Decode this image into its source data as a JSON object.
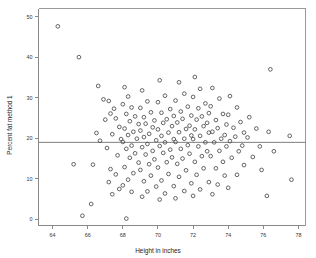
{
  "chart_data": {
    "type": "scatter",
    "title": "",
    "xlabel": "Height in inches",
    "ylabel": "Percent fat method 1",
    "xlim": [
      63.2,
      78.4
    ],
    "ylim": [
      -1.5,
      52.0
    ],
    "xticks": [
      64,
      66,
      68,
      70,
      72,
      74,
      76,
      78
    ],
    "xtick_labels": [
      "64",
      "66",
      "68",
      "70",
      "72",
      "74",
      "76",
      "78"
    ],
    "yticks": [
      0,
      10,
      20,
      30,
      40,
      50
    ],
    "ytick_labels": [
      "0",
      "10",
      "20",
      "30",
      "40",
      "50"
    ],
    "grid": false,
    "legend": false,
    "marker": "open-circle",
    "marker_color": "#4a4a4a",
    "frame_color": "#9a9a9a",
    "reference_lines": [
      {
        "orientation": "horizontal",
        "value": 19.0,
        "color": "#6f6f6f",
        "label": "mean percent fat"
      }
    ],
    "series": [
      {
        "name": "Percent fat method 1 vs Height",
        "points": [
          [
            64.3,
            47.6
          ],
          [
            65.5,
            40.0
          ],
          [
            66.6,
            32.9
          ],
          [
            66.9,
            29.6
          ],
          [
            67.2,
            29.2
          ],
          [
            67.3,
            26.1
          ],
          [
            67.0,
            24.6
          ],
          [
            66.5,
            21.3
          ],
          [
            66.7,
            19.4
          ],
          [
            66.3,
            13.5
          ],
          [
            66.2,
            3.8
          ],
          [
            65.2,
            13.6
          ],
          [
            65.7,
            0.9
          ],
          [
            67.5,
            27.3
          ],
          [
            67.6,
            24.9
          ],
          [
            67.8,
            22.8
          ],
          [
            67.4,
            21.0
          ],
          [
            67.9,
            19.8
          ],
          [
            67.1,
            17.6
          ],
          [
            67.7,
            15.8
          ],
          [
            67.3,
            12.4
          ],
          [
            67.6,
            11.1
          ],
          [
            67.2,
            9.2
          ],
          [
            67.8,
            7.5
          ],
          [
            67.4,
            6.2
          ],
          [
            68.1,
            32.6
          ],
          [
            68.3,
            30.3
          ],
          [
            68.0,
            28.4
          ],
          [
            68.5,
            27.6
          ],
          [
            68.2,
            26.0
          ],
          [
            68.7,
            25.4
          ],
          [
            68.4,
            24.2
          ],
          [
            68.9,
            23.5
          ],
          [
            68.1,
            22.4
          ],
          [
            68.6,
            21.6
          ],
          [
            68.3,
            20.8
          ],
          [
            68.8,
            19.9
          ],
          [
            68.0,
            19.1
          ],
          [
            68.5,
            18.2
          ],
          [
            68.2,
            17.4
          ],
          [
            68.7,
            16.3
          ],
          [
            68.4,
            15.2
          ],
          [
            68.9,
            14.0
          ],
          [
            68.1,
            12.9
          ],
          [
            68.6,
            11.4
          ],
          [
            68.3,
            9.8
          ],
          [
            68.0,
            8.4
          ],
          [
            68.5,
            6.8
          ],
          [
            68.2,
            0.2
          ],
          [
            69.1,
            31.8
          ],
          [
            69.4,
            29.1
          ],
          [
            69.0,
            27.5
          ],
          [
            69.6,
            26.4
          ],
          [
            69.2,
            25.2
          ],
          [
            69.8,
            24.4
          ],
          [
            69.3,
            23.6
          ],
          [
            69.7,
            22.7
          ],
          [
            69.0,
            21.9
          ],
          [
            69.5,
            21.1
          ],
          [
            69.2,
            20.3
          ],
          [
            69.9,
            19.5
          ],
          [
            69.4,
            18.6
          ],
          [
            69.1,
            17.8
          ],
          [
            69.7,
            16.9
          ],
          [
            69.3,
            16.0
          ],
          [
            69.8,
            14.8
          ],
          [
            69.5,
            13.6
          ],
          [
            69.0,
            12.2
          ],
          [
            69.6,
            10.8
          ],
          [
            69.2,
            9.4
          ],
          [
            69.9,
            8.1
          ],
          [
            69.4,
            6.9
          ],
          [
            69.1,
            5.6
          ],
          [
            70.1,
            34.3
          ],
          [
            70.4,
            30.5
          ],
          [
            70.0,
            28.9
          ],
          [
            70.7,
            27.2
          ],
          [
            70.2,
            26.3
          ],
          [
            70.9,
            25.5
          ],
          [
            70.5,
            24.7
          ],
          [
            70.3,
            23.8
          ],
          [
            70.8,
            23.0
          ],
          [
            70.0,
            22.2
          ],
          [
            70.6,
            21.4
          ],
          [
            70.2,
            20.6
          ],
          [
            70.9,
            19.8
          ],
          [
            70.4,
            19.0
          ],
          [
            70.1,
            18.1
          ],
          [
            70.7,
            17.2
          ],
          [
            70.3,
            16.4
          ],
          [
            70.8,
            15.3
          ],
          [
            70.5,
            14.1
          ],
          [
            70.0,
            12.8
          ],
          [
            70.6,
            11.2
          ],
          [
            70.2,
            9.6
          ],
          [
            70.9,
            8.2
          ],
          [
            70.4,
            6.4
          ],
          [
            70.1,
            4.9
          ],
          [
            71.2,
            33.8
          ],
          [
            71.5,
            31.0
          ],
          [
            71.0,
            29.3
          ],
          [
            71.7,
            27.8
          ],
          [
            71.3,
            26.6
          ],
          [
            71.9,
            25.6
          ],
          [
            71.4,
            24.8
          ],
          [
            71.1,
            23.9
          ],
          [
            71.8,
            23.1
          ],
          [
            71.6,
            22.3
          ],
          [
            71.2,
            21.5
          ],
          [
            71.9,
            20.7
          ],
          [
            71.5,
            19.9
          ],
          [
            71.0,
            19.1
          ],
          [
            71.7,
            18.3
          ],
          [
            71.3,
            17.4
          ],
          [
            71.8,
            16.2
          ],
          [
            71.4,
            15.0
          ],
          [
            71.1,
            13.7
          ],
          [
            71.6,
            12.1
          ],
          [
            71.2,
            10.5
          ],
          [
            71.9,
            8.9
          ],
          [
            71.5,
            7.0
          ],
          [
            71.0,
            5.2
          ],
          [
            72.1,
            35.1
          ],
          [
            72.4,
            32.2
          ],
          [
            72.0,
            30.2
          ],
          [
            72.7,
            28.6
          ],
          [
            72.3,
            27.4
          ],
          [
            72.9,
            26.2
          ],
          [
            72.5,
            25.4
          ],
          [
            72.2,
            24.6
          ],
          [
            72.8,
            23.8
          ],
          [
            72.6,
            23.0
          ],
          [
            72.1,
            22.2
          ],
          [
            72.9,
            21.4
          ],
          [
            72.4,
            20.6
          ],
          [
            72.0,
            19.8
          ],
          [
            72.7,
            19.0
          ],
          [
            72.3,
            18.0
          ],
          [
            72.8,
            16.8
          ],
          [
            72.5,
            15.6
          ],
          [
            72.1,
            14.2
          ],
          [
            72.6,
            12.6
          ],
          [
            72.2,
            11.0
          ],
          [
            72.9,
            9.2
          ],
          [
            72.4,
            7.4
          ],
          [
            72.0,
            5.8
          ],
          [
            73.1,
            32.4
          ],
          [
            73.5,
            29.8
          ],
          [
            73.0,
            27.9
          ],
          [
            73.7,
            26.0
          ],
          [
            73.3,
            24.5
          ],
          [
            73.9,
            23.4
          ],
          [
            73.4,
            22.5
          ],
          [
            73.1,
            21.6
          ],
          [
            73.8,
            20.8
          ],
          [
            73.6,
            19.9
          ],
          [
            73.2,
            19.0
          ],
          [
            73.9,
            18.0
          ],
          [
            73.5,
            16.9
          ],
          [
            73.0,
            15.6
          ],
          [
            73.7,
            14.2
          ],
          [
            73.3,
            12.6
          ],
          [
            73.8,
            10.8
          ],
          [
            73.4,
            8.6
          ],
          [
            73.1,
            6.2
          ],
          [
            74.1,
            30.4
          ],
          [
            74.5,
            27.6
          ],
          [
            74.0,
            25.8
          ],
          [
            74.7,
            24.0
          ],
          [
            74.3,
            22.6
          ],
          [
            74.9,
            21.4
          ],
          [
            74.4,
            20.4
          ],
          [
            74.1,
            19.3
          ],
          [
            74.8,
            18.2
          ],
          [
            74.6,
            16.8
          ],
          [
            74.2,
            15.2
          ],
          [
            74.9,
            13.4
          ],
          [
            74.5,
            11.0
          ],
          [
            74.0,
            7.8
          ],
          [
            75.2,
            25.2
          ],
          [
            75.6,
            22.4
          ],
          [
            75.1,
            20.2
          ],
          [
            75.8,
            18.0
          ],
          [
            75.4,
            15.4
          ],
          [
            75.9,
            12.2
          ],
          [
            76.4,
            37.0
          ],
          [
            76.3,
            21.6
          ],
          [
            76.6,
            16.8
          ],
          [
            76.2,
            5.8
          ],
          [
            77.5,
            20.6
          ],
          [
            77.6,
            9.8
          ]
        ]
      }
    ]
  },
  "axis": {
    "x_title": "Height in inches",
    "y_title": "Percent fat method 1"
  }
}
